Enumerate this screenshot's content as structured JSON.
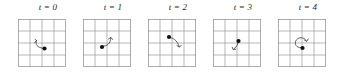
{
  "figure": {
    "type": "diagram",
    "width": 341,
    "height": 76,
    "background_color": "#ffffff",
    "grid": {
      "rows": 4,
      "cols": 4,
      "cell_size": 12,
      "line_color": "#9a9a9a",
      "border_color": "#8a8a8a",
      "line_width": 0.7
    },
    "marker": {
      "shape": "filled-circle",
      "color": "#111111",
      "radius": 2.1
    },
    "arrow": {
      "color": "#3a3a3a",
      "width": 0.8,
      "head": "open-v"
    },
    "panels": [
      {
        "label": "t = 0",
        "label_x": 9,
        "dot": {
          "x": 26.5,
          "y": 29.5
        },
        "arrow_path": "M 18.5 21.5 C 16.8 25.5 19.5 28.6 25.0 29.3",
        "arrow_head": "M 17.0 20.2 L 18.6 21.8 L 16.6 23.4"
      },
      {
        "label": "t = 1",
        "label_x": 9,
        "dot": {
          "x": 19.0,
          "y": 28.0
        },
        "arrow_path": "M 20.0 27.2 C 24.0 27.0 27.5 25.0 27.8 18.8",
        "arrow_head": "M 25.6 19.9 L 27.9 18.4 L 29.6 20.5"
      },
      {
        "label": "t = 2",
        "label_x": 9,
        "dot": {
          "x": 21.0,
          "y": 18.0
        },
        "arrow_path": "M 22.6 18.6 C 26.6 19.6 29.6 22.6 31.2 27.6",
        "arrow_head": "M 28.9 26.6 L 31.4 28.2 L 33.2 26.2"
      },
      {
        "label": "t = 3",
        "label_x": 9,
        "dot": {
          "x": 25.5,
          "y": 22.0
        },
        "arrow_path": "M 25.2 23.6 C 24.2 27.0 22.6 28.6 20.6 30.2",
        "arrow_head": "M 19.2 28.2 L 20.2 30.6 L 22.8 30.2"
      },
      {
        "label": "t = 4",
        "label_x": 9,
        "dot": {
          "x": 24.5,
          "y": 29.0
        },
        "arrow_path": "M 28.3 22.0 C 27.0 17.6 19.2 17.4 17.6 22.4 C 16.2 26.8 20.4 29.4 24.0 28.4",
        "arrow_head": "M 26.2 20.8 L 28.6 22.4 L 30.2 20.0"
      }
    ],
    "panel_x_offsets": [
      14,
      79,
      144,
      209,
      274
    ]
  }
}
